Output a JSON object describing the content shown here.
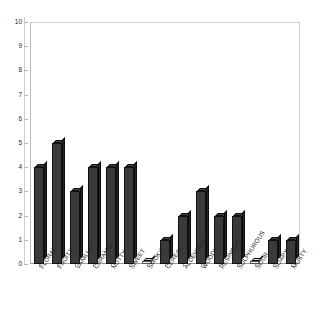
{
  "chart_data": {
    "type": "bar",
    "title": "",
    "subtitle": "",
    "xlabel": "",
    "ylabel": "",
    "ylim": [
      0,
      10
    ],
    "ytick_labels": [
      "0",
      "1",
      "2",
      "3",
      "4",
      "5",
      "6",
      "7",
      "8",
      "9",
      "10"
    ],
    "yticks": [
      0,
      1,
      2,
      3,
      4,
      5,
      6,
      7,
      8,
      9,
      10
    ],
    "grid": false,
    "legend": false,
    "legend_position": "none",
    "bar_color": "#3a3a3a",
    "bar_edge_color": "#111111",
    "plot_background": "#ffffff",
    "categories": [
      "FLORAL",
      "FRUITY",
      "VANILLA",
      "CARAMEL",
      "NUTTY",
      "SWEET",
      "SMOKY",
      "CEREAL",
      "ALDEHYDIC",
      "WOODY",
      "RESINOUS",
      "SULPHUROUS",
      "SOUR",
      "SOAPY",
      "MUSTY"
    ],
    "values": [
      4,
      5,
      3,
      4,
      4,
      4,
      0,
      1,
      2,
      3,
      2,
      2,
      0,
      1,
      1
    ]
  }
}
